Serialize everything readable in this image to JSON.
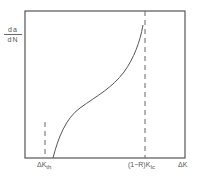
{
  "diagram": {
    "y_axis_label": {
      "numerator": "da",
      "denominator": "dN"
    },
    "x_axis_label": "ΔK",
    "threshold_label": {
      "main": "ΔK",
      "sub": "th"
    },
    "critical_label": {
      "main": "(1−R)K",
      "sub": "Ic"
    },
    "curve": "sigmoidal crack growth rate curve",
    "colors": {
      "line": "#555555",
      "background": "#ffffff"
    }
  }
}
